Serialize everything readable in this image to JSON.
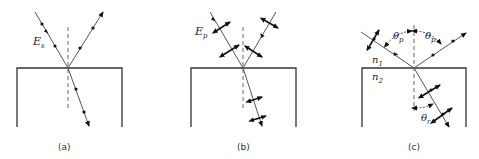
{
  "figure": {
    "panels": [
      {
        "id": "a",
        "caption": "(a)",
        "field_label": "E",
        "field_subscript": "s",
        "polarization": "s (perpendicular, dots)"
      },
      {
        "id": "b",
        "caption": "(b)",
        "field_label": "E",
        "field_subscript": "p",
        "polarization": "p (in-plane, double arrows)"
      },
      {
        "id": "c",
        "caption": "(c)",
        "n1_label": "n",
        "n1_subscript": "1",
        "n2_label": "n",
        "n2_subscript": "2",
        "theta_p_label": "θ",
        "theta_p_subscript": "p",
        "theta_r_label": "θ",
        "theta_r_subscript": "r",
        "polarization": "Brewster angle: reflected is s only"
      }
    ],
    "colors": {
      "ray": "#555555",
      "boundary": "#333333",
      "marker": "#111111"
    }
  }
}
